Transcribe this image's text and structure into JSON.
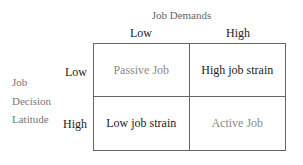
{
  "diagram": {
    "x_axis_title": "Job Demands",
    "x_categories": [
      "Low",
      "High"
    ],
    "y_axis_title_lines": [
      "Job",
      "Decision",
      "Latitude"
    ],
    "y_categories": [
      "Low",
      "High"
    ],
    "cells": [
      {
        "row": "Low",
        "col": "Low",
        "label": "Passive Job"
      },
      {
        "row": "Low",
        "col": "High",
        "label": "High job strain"
      },
      {
        "row": "High",
        "col": "Low",
        "label": "Low job strain"
      },
      {
        "row": "High",
        "col": "High",
        "label": "Active Job"
      }
    ]
  }
}
